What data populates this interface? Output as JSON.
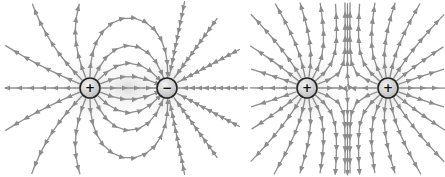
{
  "colors": {
    "field_line": "#8c8c8c",
    "arrow": "#8c8c8c",
    "charge_outline": "#222222",
    "charge_fill_center": "#f2f2f2",
    "charge_fill_edge": "#bdbdbd",
    "glow": "#d9d9d9",
    "background": "#ffffff"
  },
  "diagrams": [
    {
      "name": "dipole",
      "description": "Field lines between a positive and a negative charge",
      "charges": [
        {
          "sign": "+",
          "x": 90,
          "y": 88,
          "r": 10
        },
        {
          "sign": "−",
          "x": 167,
          "y": 88,
          "r": 10
        }
      ]
    },
    {
      "name": "like-charges",
      "description": "Field lines of two positive charges repelling",
      "charges": [
        {
          "sign": "+",
          "x": 307,
          "y": 88,
          "r": 10
        },
        {
          "sign": "+",
          "x": 388,
          "y": 88,
          "r": 10
        }
      ]
    }
  ]
}
